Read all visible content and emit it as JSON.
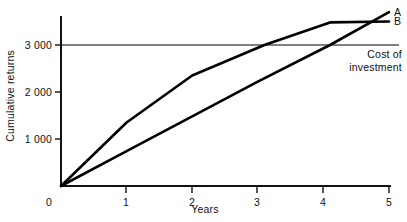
{
  "chart_data": {
    "type": "line",
    "title": "",
    "xlabel": "Years",
    "ylabel": "Cumulative returns",
    "xlim": [
      0,
      5
    ],
    "ylim": [
      0,
      3800
    ],
    "grid": false,
    "legend_position": "right-end-of-line",
    "x_ticks": [
      "0",
      "1",
      "2",
      "3",
      "4",
      "5"
    ],
    "x_tick_values": [
      0,
      1,
      2,
      3,
      4,
      5
    ],
    "y_ticks": [
      "0",
      "1 000",
      "2 000",
      "3 000"
    ],
    "y_tick_values": [
      0,
      1000,
      2000,
      3000
    ],
    "series": [
      {
        "name": "A",
        "label": "A",
        "color": "#000000",
        "x": [
          0,
          1,
          2,
          3.1,
          4.1,
          5
        ],
        "values": [
          0,
          1350,
          2350,
          3000,
          3480,
          3500
        ]
      },
      {
        "name": "B",
        "label": "B",
        "color": "#000000",
        "x": [
          0,
          1,
          2,
          3,
          4.1,
          5
        ],
        "values": [
          0,
          740,
          1480,
          2220,
          3000,
          3700
        ]
      }
    ],
    "reference_lines": [
      {
        "name": "cost-of-investment",
        "value": 3000,
        "orientation": "horizontal",
        "color": "#000000",
        "annotation": [
          "Cost of",
          "investment"
        ]
      }
    ],
    "annotations": {
      "cost_line_1": "Cost of",
      "cost_line_2": "investment"
    }
  },
  "axes": {
    "y_title": "Cumulative returns",
    "x_title": "Years"
  }
}
